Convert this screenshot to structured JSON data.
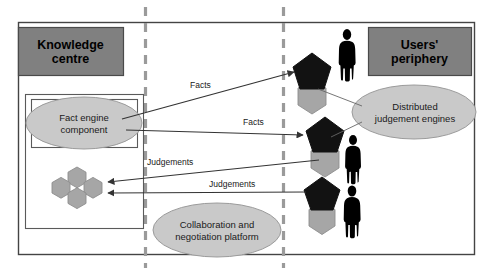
{
  "diagram": {
    "type": "block-diagram",
    "colors": {
      "zone_header_fill": "#808080",
      "ellipse_fill": "#c9c9c9",
      "hexagon_fill": "#a6a6a6",
      "pentagon_fill": "#111111",
      "person_fill": "#000000",
      "border": "#404040",
      "dashed_divider": "#9a9a9a",
      "arrow": "#333333"
    },
    "zones": [
      {
        "id": "knowledge-centre",
        "label": "Knowledge\ncentre",
        "line1": "Knowledge",
        "line2": "centre"
      },
      {
        "id": "users-periphery",
        "label": "Users'\nperiphery",
        "line1": "Users'",
        "line2": "periphery"
      }
    ],
    "nodes": [
      {
        "id": "fact-engine",
        "line1": "Fact engine",
        "line2": "component",
        "shape": "ellipse"
      },
      {
        "id": "collaboration-platform",
        "line1": "Collaboration and",
        "line2": "negotiation platform",
        "shape": "ellipse"
      },
      {
        "id": "distributed-judgement-engines",
        "line1": "Distributed",
        "line2": "judgement engines",
        "shape": "ellipse"
      },
      {
        "id": "hexagon-cluster",
        "label": "",
        "shape": "hexagon-cluster",
        "count": 4
      }
    ],
    "judgement_engines": [
      {
        "id": "judgement-engine-1",
        "shape": "pentagon-over-hexagon"
      },
      {
        "id": "judgement-engine-2",
        "shape": "pentagon-over-hexagon"
      },
      {
        "id": "judgement-engine-3",
        "shape": "pentagon-over-hexagon"
      }
    ],
    "users": [
      {
        "id": "user-figure-1"
      },
      {
        "id": "user-figure-2"
      },
      {
        "id": "user-figure-3"
      }
    ],
    "edges": [
      {
        "id": "edge-facts-1",
        "label": "Facts",
        "from": "fact-engine",
        "to": "judgement-engine-1"
      },
      {
        "id": "edge-facts-2",
        "label": "Facts",
        "from": "fact-engine",
        "to": "judgement-engine-2"
      },
      {
        "id": "edge-judgements-1",
        "label": "Judgements",
        "from": "judgement-engine-2",
        "to": "hexagon-cluster"
      },
      {
        "id": "edge-judgements-2",
        "label": "Judgements",
        "from": "judgement-engine-3",
        "to": "hexagon-cluster"
      }
    ],
    "dividers": [
      {
        "id": "divider-left",
        "style": "dashed"
      },
      {
        "id": "divider-right",
        "style": "dashed"
      }
    ]
  }
}
